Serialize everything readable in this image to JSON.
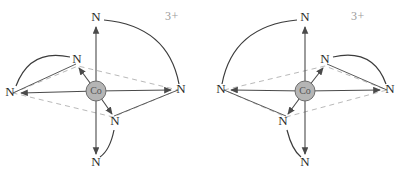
{
  "figure": {
    "background_color": "#ffffff",
    "width": 401,
    "height": 171
  },
  "style": {
    "metal_fill": "#b5b5b5",
    "metal_stroke": "#6d6d6d",
    "bond_color": "#4a4a4a",
    "plane_color": "#b9b9b9",
    "arc_color": "#3c3c3c",
    "atom_text_color": "#2b2b2b",
    "charge_text_color": "#9a9a9a",
    "metal_text_color": "#555555"
  },
  "structures": [
    {
      "id": "left-enantiomer",
      "name": "delta-isomer",
      "charge": "3+",
      "charge_pos": {
        "x": 172,
        "y": 17
      },
      "metal": {
        "symbol": "Co",
        "x": 96,
        "y": 91,
        "r": 10
      },
      "ligand_atoms": [
        {
          "key": "axial-top",
          "symbol": "N",
          "x": 96,
          "y": 18
        },
        {
          "key": "axial-bottom",
          "symbol": "N",
          "x": 96,
          "y": 163
        },
        {
          "key": "equatorial-left",
          "symbol": "N",
          "x": 10,
          "y": 93
        },
        {
          "key": "equatorial-right",
          "symbol": "N",
          "x": 181,
          "y": 90
        },
        {
          "key": "equatorial-back",
          "symbol": "N",
          "x": 77,
          "y": 60
        },
        {
          "key": "equatorial-front",
          "symbol": "N",
          "x": 115,
          "y": 122
        }
      ],
      "plane_vertices": [
        {
          "x": 13,
          "y": 93
        },
        {
          "x": 78,
          "y": 66
        },
        {
          "x": 178,
          "y": 90
        },
        {
          "x": 113,
          "y": 117
        }
      ],
      "chelate_arcs": [
        {
          "key": "arc-top-to-right",
          "from": "axial-top",
          "to": "equatorial-right"
        },
        {
          "key": "arc-left-to-back",
          "from": "equatorial-left",
          "to": "equatorial-back"
        },
        {
          "key": "arc-front-to-bottom",
          "from": "equatorial-front",
          "to": "axial-bottom"
        }
      ]
    },
    {
      "id": "right-enantiomer",
      "name": "lambda-isomer",
      "charge": "3+",
      "charge_pos": {
        "x": 358,
        "y": 17
      },
      "metal": {
        "symbol": "Co",
        "x": 305,
        "y": 91,
        "r": 10
      },
      "ligand_atoms": [
        {
          "key": "axial-top",
          "symbol": "N",
          "x": 305,
          "y": 18
        },
        {
          "key": "axial-bottom",
          "symbol": "N",
          "x": 305,
          "y": 163
        },
        {
          "key": "equatorial-left",
          "symbol": "N",
          "x": 221,
          "y": 90
        },
        {
          "key": "equatorial-right",
          "symbol": "N",
          "x": 390,
          "y": 90
        },
        {
          "key": "equatorial-back",
          "symbol": "N",
          "x": 325,
          "y": 60
        },
        {
          "key": "equatorial-front",
          "symbol": "N",
          "x": 283,
          "y": 122
        }
      ],
      "plane_vertices": [
        {
          "x": 224,
          "y": 90
        },
        {
          "x": 325,
          "y": 66
        },
        {
          "x": 387,
          "y": 90
        },
        {
          "x": 286,
          "y": 117
        }
      ],
      "chelate_arcs": [
        {
          "key": "arc-top-to-left",
          "from": "axial-top",
          "to": "equatorial-left"
        },
        {
          "key": "arc-back-to-right",
          "from": "equatorial-back",
          "to": "equatorial-right"
        },
        {
          "key": "arc-front-to-bottom",
          "from": "equatorial-front",
          "to": "axial-bottom"
        }
      ]
    }
  ]
}
